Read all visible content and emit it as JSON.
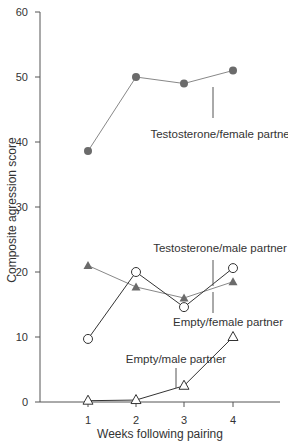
{
  "chart_data": {
    "type": "line",
    "title": "",
    "xlabel": "Weeks following pairing",
    "ylabel": "Composite agression score",
    "x": [
      1,
      2,
      3,
      4
    ],
    "xticks": [
      "1",
      "2",
      "3",
      "4"
    ],
    "yticks": [
      "0",
      "10",
      "20",
      "30",
      "40",
      "50",
      "60"
    ],
    "ylim": [
      0,
      60
    ],
    "grid": false,
    "legend_position": "inline labels",
    "series": [
      {
        "name": "Testosterone/female partner",
        "marker": "filled-circle",
        "values": [
          38.6,
          50,
          49,
          51
        ]
      },
      {
        "name": "Testosterone/male partner",
        "marker": "filled-triangle",
        "values": [
          21,
          17.7,
          16,
          18.5
        ]
      },
      {
        "name": "Empty/female partner",
        "marker": "open-circle",
        "values": [
          9.7,
          20,
          14.6,
          20.6
        ]
      },
      {
        "name": "Empty/male partner",
        "marker": "open-triangle",
        "values": [
          0.2,
          0.3,
          2.5,
          10
        ]
      }
    ]
  },
  "colors": {
    "axis": "#555555",
    "filled_marker": "#6b6b6b",
    "line": "#777777"
  }
}
